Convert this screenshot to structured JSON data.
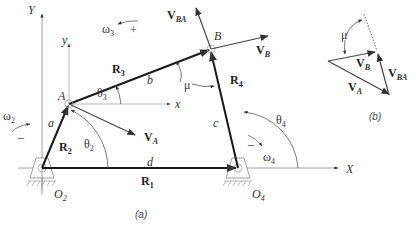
{
  "figure": {
    "captions": {
      "a": "(a)",
      "b": "(b)"
    }
  },
  "axes": {
    "global_x": "X",
    "global_y": "Y",
    "local_x": "x",
    "local_y": "y"
  },
  "points": {
    "O2": {
      "name": "O",
      "sub": "2"
    },
    "O4": {
      "name": "O",
      "sub": "4"
    },
    "A": {
      "name": "A"
    },
    "B": {
      "name": "B"
    }
  },
  "links": {
    "R1": {
      "name": "R",
      "sub": "1",
      "length_label": "d"
    },
    "R2": {
      "name": "R",
      "sub": "2",
      "length_label": "a"
    },
    "R3": {
      "name": "R",
      "sub": "3",
      "length_label": "b"
    },
    "R4": {
      "name": "R",
      "sub": "4",
      "length_label": "c"
    }
  },
  "angles": {
    "theta2": {
      "sym": "θ",
      "sub": "2"
    },
    "theta3": {
      "sym": "θ",
      "sub": "3"
    },
    "theta4": {
      "sym": "θ",
      "sub": "4"
    },
    "mu": {
      "sym": "μ"
    }
  },
  "angular_velocities": {
    "omega2": {
      "sym": "ω",
      "sub": "2",
      "sign": "–"
    },
    "omega3": {
      "sym": "ω",
      "sub": "3",
      "sign": "+"
    },
    "omega4": {
      "sym": "ω",
      "sub": "4",
      "sign": "–"
    }
  },
  "velocities": {
    "VA": {
      "name": "V",
      "sub": "A"
    },
    "VB": {
      "name": "V",
      "sub": "B"
    },
    "VBA": {
      "name": "V",
      "sub": "BA"
    }
  },
  "colors": {
    "link": "#1a1a1a",
    "vector": "#444444",
    "axis": "#888888",
    "text": "#333333"
  }
}
